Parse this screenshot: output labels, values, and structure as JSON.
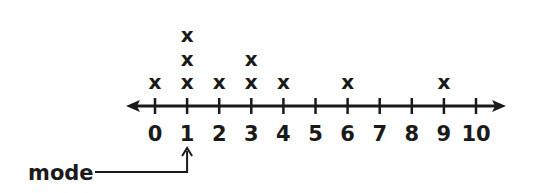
{
  "chart_data": {
    "type": "dot_plot",
    "title": "",
    "xlabel": "",
    "ylabel": "",
    "xlim": [
      0,
      10
    ],
    "tick_labels": [
      "0",
      "1",
      "2",
      "3",
      "4",
      "5",
      "6",
      "7",
      "8",
      "9",
      "10"
    ],
    "marker": "x",
    "values": [
      0,
      1,
      1,
      1,
      2,
      3,
      3,
      4,
      6,
      9
    ],
    "counts": {
      "0": 1,
      "1": 3,
      "2": 1,
      "3": 2,
      "4": 1,
      "5": 0,
      "6": 1,
      "7": 0,
      "8": 0,
      "9": 1,
      "10": 0
    },
    "grid": false,
    "annotations": [
      {
        "text": "mode",
        "points_to": 1
      }
    ]
  },
  "colors": {
    "ink": "#1a1a1a",
    "background": "#ffffff"
  }
}
